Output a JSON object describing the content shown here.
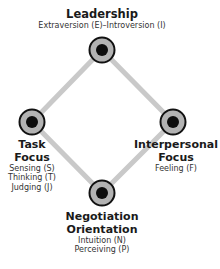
{
  "colors": {
    "connector": "#c9c9c9",
    "node_ring": "#b3b3b3",
    "node_border": "#111111",
    "node_core": "#0d0d0d"
  },
  "nodes": {
    "top": {
      "title_lines": [
        "Leadership"
      ],
      "subtitle_lines": [
        "Extraversion (E)–Introversion (I)"
      ]
    },
    "left": {
      "title_lines": [
        "Task",
        "Focus"
      ],
      "subtitle_lines": [
        "Sensing (S)",
        "Thinking (T)",
        "Judging (J)"
      ]
    },
    "right": {
      "title_lines": [
        "Interpersonal",
        "Focus"
      ],
      "subtitle_lines": [
        "Feeling (F)"
      ]
    },
    "bottom": {
      "title_lines": [
        "Negotiation",
        "Orientation"
      ],
      "subtitle_lines": [
        "Intuition (N)",
        "Perceiving (P)"
      ]
    }
  }
}
